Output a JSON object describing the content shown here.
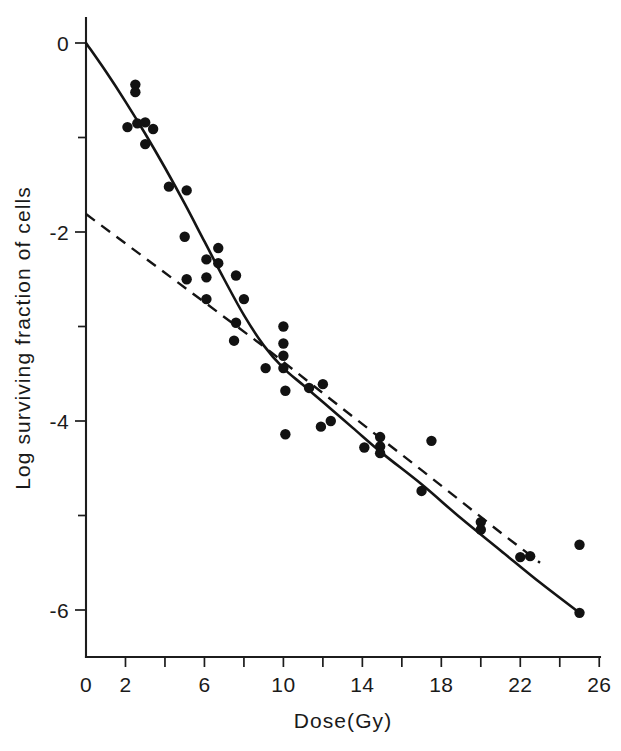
{
  "figure": {
    "background_color": "#ffffff",
    "ink_color": "#141414"
  },
  "chart_data": {
    "type": "scatter",
    "title": "",
    "subtitle": "",
    "xlabel": "Dose(Gy)",
    "ylabel": "Log surviving fraction of cells",
    "xlim": [
      0,
      26.9
    ],
    "ylim": [
      -6.5,
      0.26
    ],
    "grid": false,
    "legend": null,
    "x_ticks_major": [
      0,
      2,
      6,
      10,
      14,
      18,
      22,
      26
    ],
    "x_tick_labels": [
      "0",
      "2",
      "6",
      "10",
      "14",
      "18",
      "22",
      "26"
    ],
    "x_ticks_all": [
      0,
      2,
      4,
      6,
      8,
      10,
      12,
      14,
      16,
      18,
      20,
      22,
      24,
      26
    ],
    "y_ticks_major": [
      0,
      -2,
      -4,
      -6
    ],
    "y_tick_labels": [
      "0",
      "-2",
      "-4",
      "-6"
    ],
    "y_ticks_all": [
      0,
      -1,
      -2,
      -3,
      -4,
      -5,
      -6
    ],
    "series": [
      {
        "name": "survival-data-points",
        "type": "scatter",
        "marker": "filled-circle",
        "marker_radius_px": 5.2,
        "color": "#121212",
        "points": [
          [
            2.5,
            -0.44
          ],
          [
            2.5,
            -0.52
          ],
          [
            2.1,
            -0.89
          ],
          [
            2.6,
            -0.85
          ],
          [
            3.0,
            -0.84
          ],
          [
            3.4,
            -0.91
          ],
          [
            3.0,
            -1.07
          ],
          [
            4.2,
            -1.52
          ],
          [
            5.1,
            -1.56
          ],
          [
            5.0,
            -2.05
          ],
          [
            6.7,
            -2.17
          ],
          [
            6.1,
            -2.29
          ],
          [
            6.7,
            -2.33
          ],
          [
            7.6,
            -2.46
          ],
          [
            6.1,
            -2.48
          ],
          [
            5.1,
            -2.5
          ],
          [
            8.0,
            -2.71
          ],
          [
            6.1,
            -2.71
          ],
          [
            7.6,
            -2.96
          ],
          [
            7.5,
            -3.15
          ],
          [
            10.0,
            -3.0
          ],
          [
            10.0,
            -3.18
          ],
          [
            10.0,
            -3.31
          ],
          [
            10.0,
            -3.44
          ],
          [
            9.1,
            -3.44
          ],
          [
            10.1,
            -3.68
          ],
          [
            11.3,
            -3.65
          ],
          [
            12.0,
            -3.61
          ],
          [
            11.9,
            -4.06
          ],
          [
            12.4,
            -4.0
          ],
          [
            10.1,
            -4.14
          ],
          [
            14.1,
            -4.28
          ],
          [
            14.9,
            -4.17
          ],
          [
            14.9,
            -4.27
          ],
          [
            14.9,
            -4.34
          ],
          [
            17.5,
            -4.21
          ],
          [
            17.0,
            -4.74
          ],
          [
            20.0,
            -5.07
          ],
          [
            20.0,
            -5.15
          ],
          [
            22.0,
            -5.44
          ],
          [
            22.5,
            -5.43
          ],
          [
            25.0,
            -5.31
          ],
          [
            25.0,
            -6.03
          ]
        ]
      },
      {
        "name": "linear-quadratic-fit",
        "type": "line",
        "style": "solid",
        "color": "#141414",
        "points": [
          [
            0.0,
            0.0
          ],
          [
            1.0,
            -0.3
          ],
          [
            2.0,
            -0.62
          ],
          [
            3.0,
            -0.96
          ],
          [
            4.0,
            -1.32
          ],
          [
            5.0,
            -1.7
          ],
          [
            6.0,
            -2.1
          ],
          [
            7.0,
            -2.5
          ],
          [
            8.0,
            -2.88
          ],
          [
            9.0,
            -3.2
          ],
          [
            10.0,
            -3.44
          ],
          [
            11.0,
            -3.62
          ],
          [
            12.0,
            -3.8
          ],
          [
            13.5,
            -4.07
          ],
          [
            15.0,
            -4.34
          ],
          [
            17.0,
            -4.67
          ],
          [
            19.0,
            -5.03
          ],
          [
            21.0,
            -5.37
          ],
          [
            23.0,
            -5.71
          ],
          [
            25.0,
            -6.03
          ]
        ]
      },
      {
        "name": "terminal-slope-extrapolation",
        "type": "line",
        "style": "dashed",
        "color": "#141414",
        "points": [
          [
            0.0,
            -1.81
          ],
          [
            9.0,
            -3.21
          ],
          [
            13.0,
            -3.87
          ],
          [
            17.0,
            -4.52
          ],
          [
            21.0,
            -5.18
          ],
          [
            23.0,
            -5.5
          ]
        ]
      }
    ],
    "annotations": []
  },
  "axis_labels": {
    "x_title": "Dose(Gy)",
    "y_title": "Log surviving fraction of cells"
  }
}
